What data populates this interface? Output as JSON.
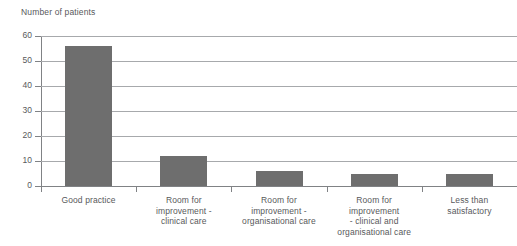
{
  "chart_data": {
    "type": "bar",
    "title": "",
    "ylabel": "Number of patients",
    "xlabel": "",
    "ylim": [
      0,
      60
    ],
    "yticks": [
      0,
      10,
      20,
      30,
      40,
      50,
      60
    ],
    "grid": true,
    "legend": "none",
    "orientation": "vertical",
    "bar_color": "#6e6e6e",
    "categories": [
      "Good practice",
      "Room for improvement - clinical care",
      "Room for improvement - organisational care",
      "Room for improvement - clinical and organisational care",
      "Less than satisfactory"
    ],
    "category_label_lines": [
      [
        "Good practice"
      ],
      [
        "Room for",
        "improvement -",
        "clinical care"
      ],
      [
        "Room for",
        "improvement -",
        "organisational care"
      ],
      [
        "Room for",
        "improvement",
        "- clinical and",
        "organisational care"
      ],
      [
        "Less than",
        "satisfactory"
      ]
    ],
    "values": [
      56,
      12,
      6,
      5,
      5
    ]
  },
  "axis": {
    "y_title": "Number of patients",
    "tick_labels": [
      "60",
      "50",
      "40",
      "30",
      "20",
      "10",
      "0"
    ]
  },
  "colors": {
    "bar": "#6e6e6e",
    "gridline": "#a7a9ac",
    "axis": "#808285",
    "text": "#58595b",
    "background": "#ffffff"
  }
}
